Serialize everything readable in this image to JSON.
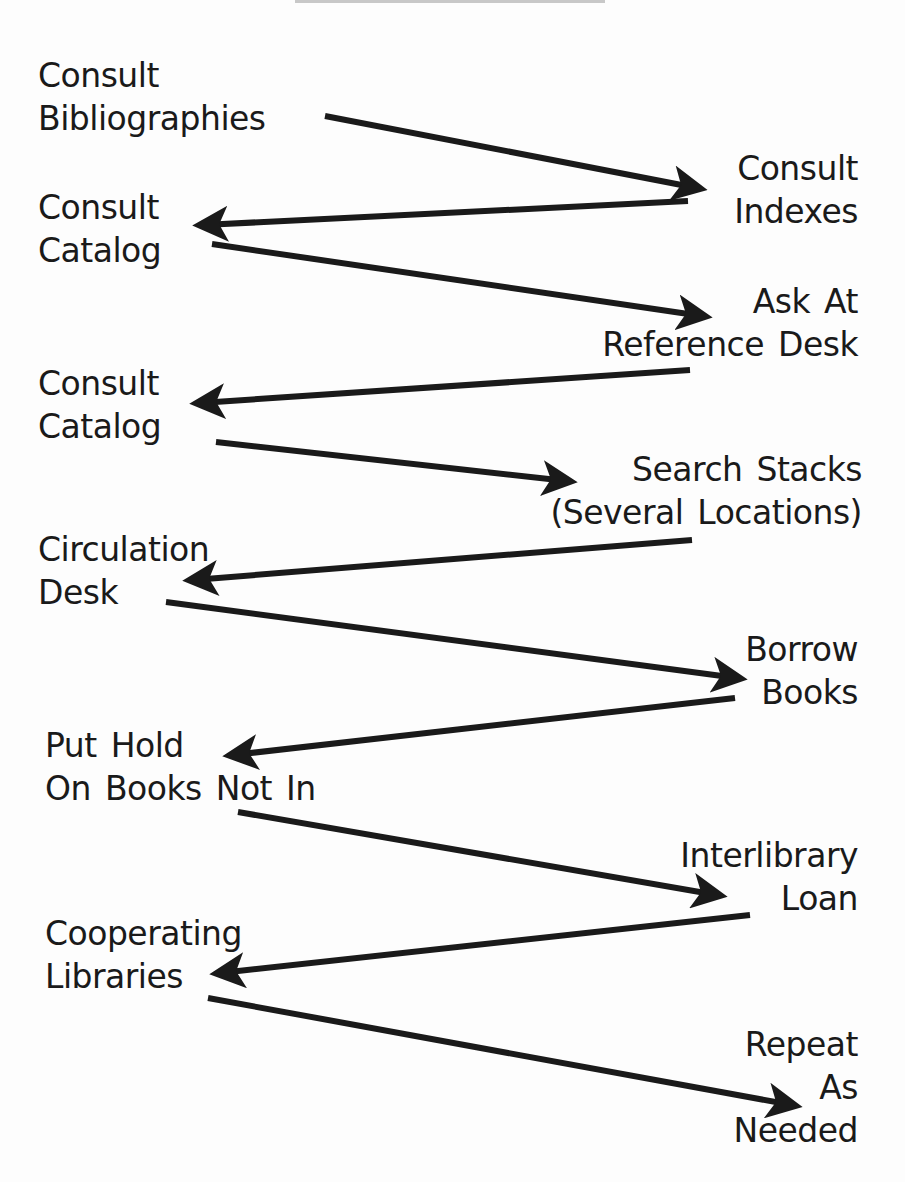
{
  "diagram": {
    "type": "zigzag-flow",
    "steps": [
      {
        "id": "s1",
        "lines": [
          "Consult",
          "Bibliographies"
        ],
        "side": "left",
        "x": 38,
        "y": 54
      },
      {
        "id": "s2",
        "lines": [
          "Consult",
          "Indexes"
        ],
        "side": "right",
        "x": 858,
        "y": 147
      },
      {
        "id": "s3",
        "lines": [
          "Consult",
          "Catalog"
        ],
        "side": "left",
        "x": 38,
        "y": 186
      },
      {
        "id": "s4",
        "lines": [
          "Ask At",
          "Reference Desk"
        ],
        "side": "right",
        "x": 858,
        "y": 280
      },
      {
        "id": "s5",
        "lines": [
          "Consult",
          "Catalog"
        ],
        "side": "left",
        "x": 38,
        "y": 362
      },
      {
        "id": "s6",
        "lines": [
          "Search Stacks",
          "(Several Locations)"
        ],
        "side": "right",
        "x": 862,
        "y": 448
      },
      {
        "id": "s7",
        "lines": [
          "Circulation",
          "Desk"
        ],
        "side": "left",
        "x": 38,
        "y": 528
      },
      {
        "id": "s8",
        "lines": [
          "Borrow",
          "Books"
        ],
        "side": "right",
        "x": 858,
        "y": 628
      },
      {
        "id": "s9",
        "lines": [
          "Put Hold",
          "On Books Not In"
        ],
        "side": "left",
        "x": 45,
        "y": 724
      },
      {
        "id": "s10",
        "lines": [
          "Interlibrary",
          "Loan"
        ],
        "side": "right",
        "x": 858,
        "y": 834
      },
      {
        "id": "s11",
        "lines": [
          "Cooperating",
          "Libraries"
        ],
        "side": "left",
        "x": 45,
        "y": 912
      },
      {
        "id": "s12",
        "lines": [
          "Repeat",
          "As",
          "Needed"
        ],
        "side": "right",
        "x": 858,
        "y": 1023
      }
    ],
    "arrows": [
      {
        "from": "s1",
        "to": "s2",
        "x1": 325,
        "y1": 116,
        "x2": 697,
        "y2": 188
      },
      {
        "from": "s2",
        "to": "s3",
        "x1": 688,
        "y1": 201,
        "x2": 203,
        "y2": 225
      },
      {
        "from": "s3",
        "to": "s4",
        "x1": 212,
        "y1": 244,
        "x2": 702,
        "y2": 316
      },
      {
        "from": "s4",
        "to": "s5",
        "x1": 690,
        "y1": 370,
        "x2": 200,
        "y2": 403
      },
      {
        "from": "s5",
        "to": "s6",
        "x1": 216,
        "y1": 442,
        "x2": 567,
        "y2": 481
      },
      {
        "from": "s6",
        "to": "s7",
        "x1": 692,
        "y1": 540,
        "x2": 193,
        "y2": 580
      },
      {
        "from": "s7",
        "to": "s8",
        "x1": 166,
        "y1": 602,
        "x2": 737,
        "y2": 678
      },
      {
        "from": "s8",
        "to": "s9",
        "x1": 735,
        "y1": 698,
        "x2": 233,
        "y2": 755
      },
      {
        "from": "s9",
        "to": "s10",
        "x1": 238,
        "y1": 812,
        "x2": 717,
        "y2": 895
      },
      {
        "from": "s10",
        "to": "s11",
        "x1": 750,
        "y1": 915,
        "x2": 220,
        "y2": 973
      },
      {
        "from": "s11",
        "to": "s12",
        "x1": 208,
        "y1": 998,
        "x2": 792,
        "y2": 1105
      }
    ],
    "colors": {
      "ink": "#1a1a1a",
      "background": "#fdfdfd",
      "top_rule": "#c8c8c8"
    }
  }
}
